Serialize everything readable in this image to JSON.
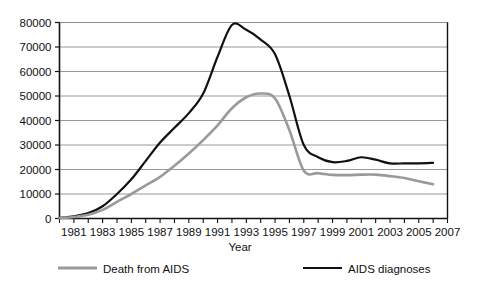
{
  "chart_data": {
    "type": "line",
    "title": "",
    "xlabel": "Year",
    "ylabel": "",
    "xlim": [
      1980,
      2007
    ],
    "ylim": [
      0,
      80000
    ],
    "ytick_step": 10000,
    "grid": true,
    "legend_position": "bottom",
    "x_tick_labels": [
      "1981",
      "1983",
      "1985",
      "1987",
      "1989",
      "1991",
      "1993",
      "1995",
      "1997",
      "1999",
      "2001",
      "2003",
      "2005",
      "2007"
    ],
    "x_tick_values": [
      1981,
      1983,
      1985,
      1987,
      1989,
      1991,
      1993,
      1995,
      1997,
      1999,
      2001,
      2003,
      2005,
      2007
    ],
    "x_minor_ticks": [
      1980,
      1981,
      1982,
      1983,
      1984,
      1985,
      1986,
      1987,
      1988,
      1989,
      1990,
      1991,
      1992,
      1993,
      1994,
      1995,
      1996,
      1997,
      1998,
      1999,
      2000,
      2001,
      2002,
      2003,
      2004,
      2005,
      2006,
      2007
    ],
    "y_tick_labels": [
      "0",
      "10000",
      "20000",
      "30000",
      "40000",
      "50000",
      "60000",
      "70000",
      "80000"
    ],
    "y_tick_values": [
      0,
      10000,
      20000,
      30000,
      40000,
      50000,
      60000,
      70000,
      80000
    ],
    "x": [
      1980,
      1981,
      1982,
      1983,
      1984,
      1985,
      1986,
      1987,
      1988,
      1989,
      1990,
      1991,
      1992,
      1993,
      1994,
      1995,
      1996,
      1997,
      1998,
      1999,
      2000,
      2001,
      2002,
      2003,
      2004,
      2005,
      2006
    ],
    "series": [
      {
        "name": "AIDS diagnoses",
        "color": "#111111",
        "width": 2.2,
        "values": [
          300,
          900,
          2200,
          5000,
          10000,
          16000,
          23500,
          31000,
          37000,
          43000,
          51000,
          66000,
          79000,
          77000,
          73000,
          67000,
          50000,
          30000,
          25000,
          23000,
          23500,
          25000,
          24000,
          22500,
          22500,
          22500,
          22700
        ]
      },
      {
        "name": "Death from AIDS",
        "color": "#9a9a9a",
        "width": 2.6,
        "values": [
          200,
          600,
          1500,
          3500,
          6800,
          10000,
          13500,
          17000,
          21500,
          26500,
          32000,
          38000,
          45000,
          49500,
          51000,
          49000,
          36000,
          19500,
          18500,
          17800,
          17700,
          17900,
          17900,
          17300,
          16500,
          15200,
          14000
        ]
      }
    ],
    "legend": [
      {
        "label": "Death from AIDS",
        "color": "#9a9a9a",
        "width": 3.2
      },
      {
        "label": "AIDS diagnoses",
        "color": "#111111",
        "width": 2.2
      }
    ]
  }
}
